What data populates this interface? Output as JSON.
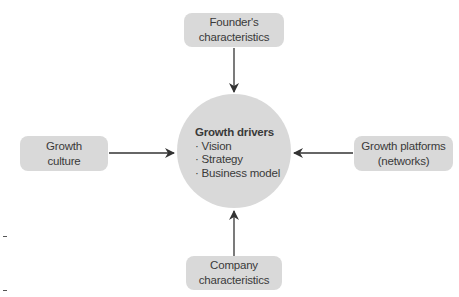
{
  "diagram": {
    "hub": {
      "title": "Growth drivers",
      "items": [
        "· Vision",
        "· Strategy",
        "· Business model"
      ]
    },
    "nodes": {
      "top": {
        "line1": "Founder's",
        "line2": "characteristics"
      },
      "left": {
        "line1": "Growth",
        "line2": "culture"
      },
      "right": {
        "line1": "Growth platforms",
        "line2": "(networks)"
      },
      "bottom": {
        "line1": "Company",
        "line2": "characteristics"
      }
    },
    "colors": {
      "box_fill": "#d9d9d9",
      "arrow": "#333333",
      "text": "#3a3a3a"
    }
  }
}
